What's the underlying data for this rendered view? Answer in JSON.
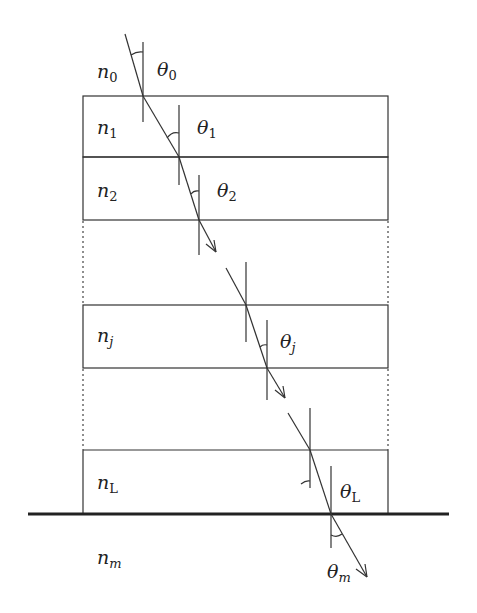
{
  "diagram": {
    "media": [
      {
        "id": "n0",
        "label": "n",
        "sub": "0",
        "x": 97,
        "y": 62
      },
      {
        "id": "n1",
        "label": "n",
        "sub": "1",
        "x": 97,
        "y": 118
      },
      {
        "id": "n2",
        "label": "n",
        "sub": "2",
        "x": 97,
        "y": 181
      },
      {
        "id": "nj",
        "label": "n",
        "sub": "j",
        "x": 97,
        "y": 326
      },
      {
        "id": "nL",
        "label": "n",
        "sub": "L",
        "x": 97,
        "y": 473
      },
      {
        "id": "nm",
        "label": "n",
        "sub": "m",
        "x": 97,
        "y": 548
      }
    ],
    "angles": [
      {
        "id": "theta0",
        "label": "θ",
        "sub": "0",
        "x": 157,
        "y": 60
      },
      {
        "id": "theta1",
        "label": "θ",
        "sub": "1",
        "x": 197,
        "y": 118
      },
      {
        "id": "theta2",
        "label": "θ",
        "sub": "2",
        "x": 217,
        "y": 181
      },
      {
        "id": "thetaj",
        "label": "θ",
        "sub": "j",
        "x": 280,
        "y": 332
      },
      {
        "id": "thetaL",
        "label": "θ",
        "sub": "L",
        "x": 340,
        "y": 482
      },
      {
        "id": "thetam",
        "label": "θ",
        "sub": "m",
        "x": 327,
        "y": 562
      }
    ],
    "layers": [
      {
        "name": "layer-1",
        "top": 96,
        "bottom": 157
      },
      {
        "name": "layer-2",
        "top": 157,
        "bottom": 220
      },
      {
        "name": "layer-j",
        "top": 305,
        "bottom": 368
      },
      {
        "name": "layer-L",
        "top": 450,
        "bottom": 513
      }
    ],
    "box": {
      "left": 83,
      "right": 388
    },
    "substrate": {
      "y": 514,
      "x1": 28,
      "x2": 449
    }
  }
}
